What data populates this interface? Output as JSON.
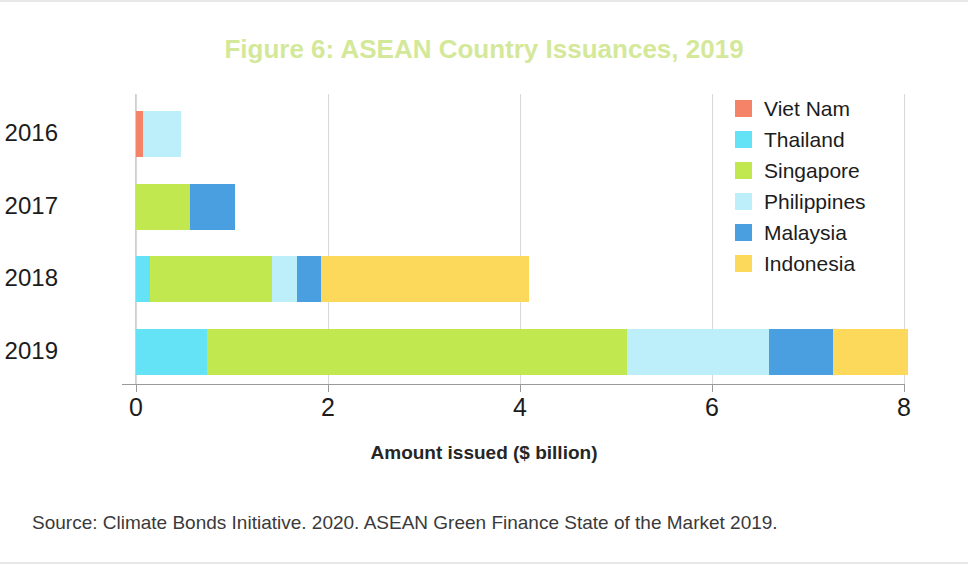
{
  "figure": {
    "title": "Figure 6: ASEAN Country Issuances, 2019",
    "title_color": "#d4e89a",
    "source": "Source: Climate Bonds Initiative. 2020. ASEAN Green Finance State of the Market 2019."
  },
  "chart_data": {
    "type": "bar",
    "orientation": "horizontal",
    "stacked": true,
    "title": "Figure 6: ASEAN Country Issuances, 2019",
    "xlabel": "Amount issued ($ billion)",
    "ylabel": "",
    "xlim": [
      0,
      8
    ],
    "xticks": [
      0,
      2,
      4,
      6,
      8
    ],
    "xtick_labels": [
      "0",
      "2",
      "4",
      "6",
      "8"
    ],
    "grid": "vertical",
    "legend_position": "right",
    "categories": [
      "2016",
      "2017",
      "2018",
      "2019"
    ],
    "series": [
      {
        "name": "Viet Nam",
        "color": "#f58368",
        "values": [
          0.07,
          0.0,
          0.0,
          0.0
        ]
      },
      {
        "name": "Thailand",
        "color": "#63e3f5",
        "values": [
          0.0,
          0.0,
          0.15,
          0.74
        ]
      },
      {
        "name": "Singapore",
        "color": "#c1e84f",
        "values": [
          0.0,
          0.56,
          1.27,
          4.37
        ]
      },
      {
        "name": "Philippines",
        "color": "#bdeffb",
        "values": [
          0.4,
          0.0,
          0.26,
          1.48
        ]
      },
      {
        "name": "Malaysia",
        "color": "#4a9fe0",
        "values": [
          0.0,
          0.47,
          0.25,
          0.67
        ]
      },
      {
        "name": "Indonesia",
        "color": "#fcd95b",
        "values": [
          0.0,
          0.0,
          2.16,
          0.78
        ]
      }
    ],
    "totals": [
      0.47,
      1.03,
      4.09,
      8.04
    ],
    "stack_order": [
      "Viet Nam",
      "Thailand",
      "Singapore",
      "Philippines",
      "Malaysia",
      "Indonesia"
    ]
  },
  "legend": {
    "items": [
      {
        "label": "Viet Nam",
        "color": "#f58368"
      },
      {
        "label": "Thailand",
        "color": "#63e3f5"
      },
      {
        "label": "Singapore",
        "color": "#c1e84f"
      },
      {
        "label": "Philippines",
        "color": "#bdeffb"
      },
      {
        "label": "Malaysia",
        "color": "#4a9fe0"
      },
      {
        "label": "Indonesia",
        "color": "#fcd95b"
      }
    ]
  }
}
